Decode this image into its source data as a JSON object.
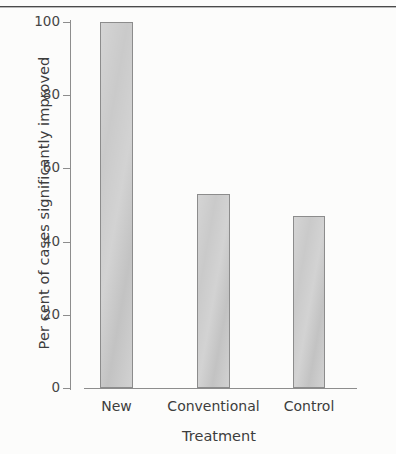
{
  "chart_data": {
    "type": "bar",
    "title": "",
    "categories": [
      "New",
      "Conventional",
      "Control"
    ],
    "values": [
      100,
      53,
      47
    ],
    "xlabel": "Treatment",
    "ylabel": "Per cent of cases significantly improved",
    "ylim": [
      0,
      100
    ],
    "yticks": [
      0,
      20,
      40,
      60,
      80,
      100
    ],
    "ytick_labels": [
      "0",
      "20",
      "40",
      "60",
      "80",
      "100"
    ],
    "grid": false,
    "legend": false,
    "bar_fill_color": "#c9c9c9",
    "bar_edge_color": "#8c8c8c",
    "axis_color": "#8d8d8d",
    "text_color": "#3d3d3d",
    "background_color": "#ffffff"
  }
}
